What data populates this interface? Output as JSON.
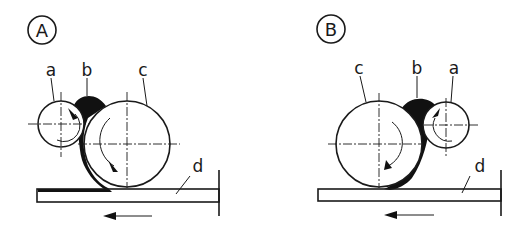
{
  "panels": [
    {
      "id": "A",
      "badge": "A",
      "labels": {
        "a": "a",
        "b": "b",
        "c": "c",
        "d": "d"
      },
      "feed_direction": "left",
      "arrangement": "small roll a left of large roll c, material b between them, c in contact with plate d"
    },
    {
      "id": "B",
      "badge": "B",
      "labels": {
        "a": "a",
        "b": "b",
        "c": "c",
        "d": "d"
      },
      "feed_direction": "left",
      "arrangement": "large roll c left of small roll a, material b between them, c in contact with plate d"
    }
  ],
  "colors": {
    "ink": "#1a1a1a",
    "fill": "#111111",
    "background": "#ffffff"
  }
}
